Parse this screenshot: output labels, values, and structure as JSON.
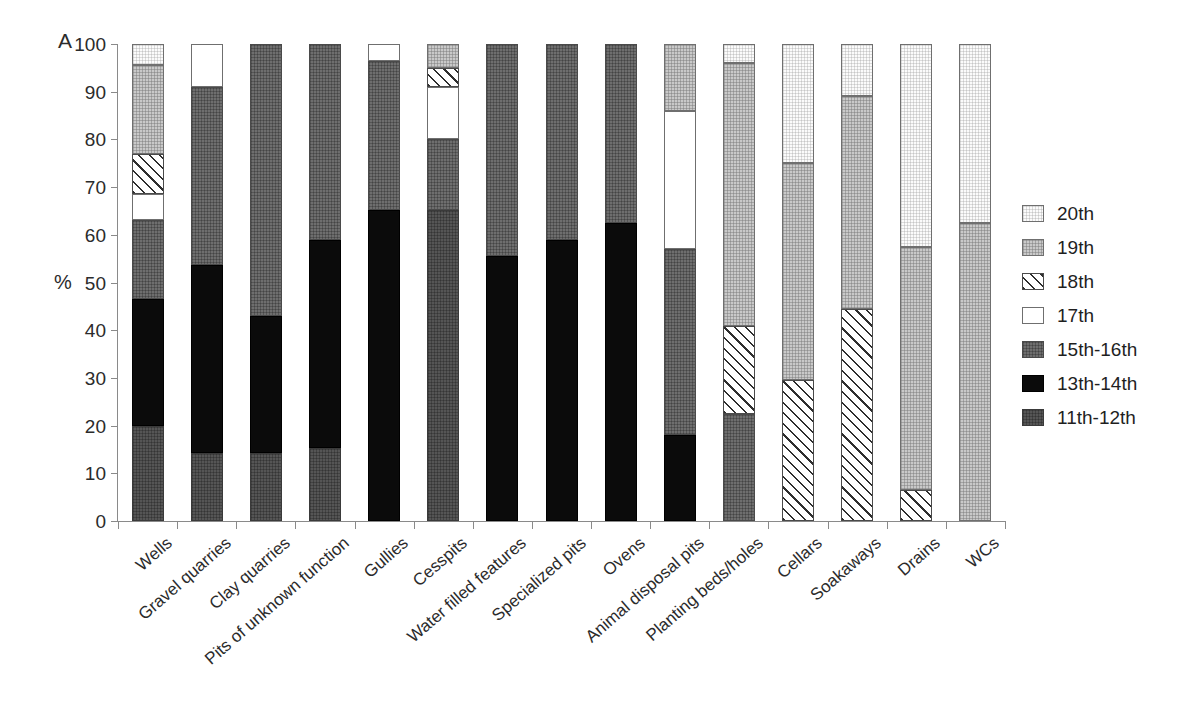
{
  "panel_letter": "A",
  "y_axis_title": "%",
  "legend": {
    "position": "right",
    "items": [
      {
        "key": "20th",
        "label": "20th",
        "swatch": "very-light-gray-grid"
      },
      {
        "key": "19th",
        "label": "19th",
        "swatch": "light-gray-grid"
      },
      {
        "key": "18th",
        "label": "18th",
        "swatch": "diagonal-hatch"
      },
      {
        "key": "17th",
        "label": "17th",
        "swatch": "white"
      },
      {
        "key": "15th-16th",
        "label": "15th-16th",
        "swatch": "medium-gray-grid"
      },
      {
        "key": "13th-14th",
        "label": "13th-14th",
        "swatch": "black"
      },
      {
        "key": "11th-12th",
        "label": "11th-12th",
        "swatch": "dark-gray-grid"
      }
    ]
  },
  "chart_data": {
    "type": "bar",
    "subtype": "stacked-100-percent",
    "title": "",
    "xlabel": "",
    "ylabel": "%",
    "ylim": [
      0,
      100
    ],
    "yticks": [
      0,
      10,
      20,
      30,
      40,
      50,
      60,
      70,
      80,
      90,
      100
    ],
    "grid": false,
    "legend_position": "right",
    "categories": [
      "Wells",
      "Gravel quarries",
      "Clay quarries",
      "Pits of unknown function",
      "Gullies",
      "Cesspits",
      "Water filled features",
      "Specialized pits",
      "Ovens",
      "Animal disposal pits",
      "Planting beds/holes",
      "Cellars",
      "Soakaways",
      "Drains",
      "WCs"
    ],
    "series": [
      {
        "name": "11th-12th",
        "values": [
          20.0,
          14.3,
          14.3,
          15.2,
          0.0,
          65.2,
          0.0,
          0.0,
          0.0,
          0.0,
          0.0,
          0.0,
          0.0,
          0.0,
          0.0
        ]
      },
      {
        "name": "13th-14th",
        "values": [
          26.5,
          39.3,
          28.6,
          43.8,
          65.2,
          0.0,
          55.6,
          59.0,
          62.5,
          18.0,
          0.0,
          0.0,
          0.0,
          0.0,
          0.0
        ]
      },
      {
        "name": "15th-16th",
        "values": [
          16.5,
          37.4,
          57.1,
          41.0,
          31.3,
          14.8,
          44.4,
          41.0,
          37.5,
          39.0,
          22.4,
          0.0,
          0.0,
          0.0,
          0.0
        ]
      },
      {
        "name": "17th",
        "values": [
          5.5,
          9.0,
          0.0,
          0.0,
          3.5,
          11.0,
          0.0,
          0.0,
          0.0,
          29.0,
          0.0,
          0.0,
          0.0,
          0.0,
          0.0
        ]
      },
      {
        "name": "18th",
        "values": [
          8.5,
          0.0,
          0.0,
          0.0,
          0.0,
          4.0,
          0.0,
          0.0,
          0.0,
          0.0,
          18.4,
          29.5,
          44.5,
          6.5,
          0.0
        ]
      },
      {
        "name": "19th",
        "values": [
          18.5,
          0.0,
          0.0,
          0.0,
          0.0,
          5.0,
          0.0,
          0.0,
          0.0,
          14.0,
          55.2,
          45.5,
          44.5,
          51.0,
          62.5
        ]
      },
      {
        "name": "20th",
        "values": [
          4.5,
          0.0,
          0.0,
          0.0,
          0.0,
          0.0,
          0.0,
          0.0,
          0.0,
          0.0,
          4.0,
          25.0,
          11.0,
          42.5,
          37.5
        ]
      }
    ],
    "stack_order_bottom_to_top": [
      "11th-12th",
      "13th-14th",
      "15th-16th",
      "17th",
      "18th",
      "19th",
      "20th"
    ]
  }
}
